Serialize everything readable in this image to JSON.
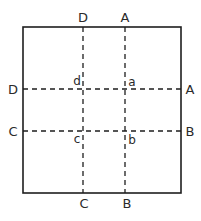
{
  "diagram": {
    "type": "folding-diagram",
    "outer_rectangle": {
      "left": 23,
      "top": 27,
      "right": 181,
      "bottom": 193
    },
    "fold_lines": [
      {
        "id": "DC",
        "orientation": "vertical",
        "position": 83,
        "start_label": "D",
        "end_label": "C"
      },
      {
        "id": "AB",
        "orientation": "vertical",
        "position": 125,
        "start_label": "A",
        "end_label": "B"
      },
      {
        "id": "DA",
        "orientation": "horizontal",
        "position": 89,
        "start_label": "D",
        "end_label": "A"
      },
      {
        "id": "CB",
        "orientation": "horizontal",
        "position": 131,
        "start_label": "C",
        "end_label": "B"
      }
    ],
    "edge_labels": {
      "top_left": "D",
      "top_right": "A",
      "left_upper": "D",
      "right_upper": "A",
      "left_lower": "C",
      "right_lower": "B",
      "bottom_left": "C",
      "bottom_right": "B"
    },
    "intersection_labels": {
      "upper_left": "d",
      "upper_right": "a",
      "lower_left": "c",
      "lower_right": "b"
    },
    "colors": {
      "line": "#1e1e1e",
      "text": "#2a2a2a",
      "background": "#ffffff"
    }
  }
}
